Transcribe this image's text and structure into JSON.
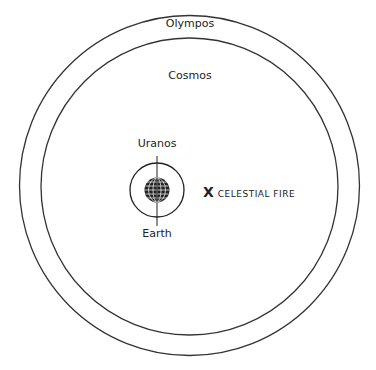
{
  "diagram": {
    "type": "concentric-cosmology",
    "labels": {
      "outer_ring": "Olympos",
      "inner_region": "Cosmos",
      "upper_pointer": "Uranos",
      "lower_pointer": "Earth"
    },
    "marker": {
      "symbol": "X",
      "text": "CELESTIAL FIRE"
    },
    "colors": {
      "stroke": "#222222",
      "background": "#ffffff"
    }
  }
}
